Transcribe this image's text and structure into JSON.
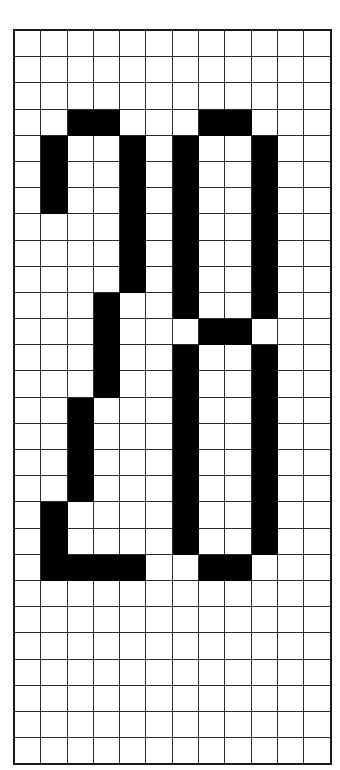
{
  "canvas": {
    "width": 340,
    "height": 770,
    "background": "#ffffff"
  },
  "figure": {
    "name": "pixel-grid-glyph-figure",
    "cell_on_color": "#000000",
    "cell_off_color": "#ffffff",
    "gridline_color": "#2b2b2b",
    "border_color": "#1a1a1a"
  },
  "grid": {
    "columns": 12,
    "rows": 28,
    "cell_width_px": 25.3,
    "cell_height_px": 25.2,
    "origin_x_px": 13,
    "origin_y_px": 29,
    "show_gridlines": true,
    "filled_cells": [
      [
        3,
        2
      ],
      [
        3,
        3
      ],
      [
        3,
        7
      ],
      [
        3,
        8
      ],
      [
        4,
        1
      ],
      [
        4,
        4
      ],
      [
        4,
        6
      ],
      [
        4,
        9
      ],
      [
        5,
        1
      ],
      [
        5,
        4
      ],
      [
        5,
        6
      ],
      [
        5,
        9
      ],
      [
        6,
        1
      ],
      [
        6,
        4
      ],
      [
        6,
        6
      ],
      [
        6,
        9
      ],
      [
        7,
        4
      ],
      [
        7,
        6
      ],
      [
        7,
        9
      ],
      [
        8,
        4
      ],
      [
        8,
        6
      ],
      [
        8,
        9
      ],
      [
        9,
        4
      ],
      [
        9,
        6
      ],
      [
        9,
        9
      ],
      [
        10,
        3
      ],
      [
        10,
        6
      ],
      [
        10,
        9
      ],
      [
        11,
        3
      ],
      [
        11,
        7
      ],
      [
        11,
        8
      ],
      [
        12,
        3
      ],
      [
        12,
        6
      ],
      [
        12,
        9
      ],
      [
        13,
        3
      ],
      [
        13,
        6
      ],
      [
        13,
        9
      ],
      [
        14,
        2
      ],
      [
        14,
        6
      ],
      [
        14,
        9
      ],
      [
        15,
        2
      ],
      [
        15,
        6
      ],
      [
        15,
        9
      ],
      [
        16,
        2
      ],
      [
        16,
        6
      ],
      [
        16,
        9
      ],
      [
        17,
        2
      ],
      [
        17,
        6
      ],
      [
        17,
        9
      ],
      [
        18,
        1
      ],
      [
        18,
        6
      ],
      [
        18,
        9
      ],
      [
        19,
        1
      ],
      [
        19,
        6
      ],
      [
        19,
        9
      ],
      [
        20,
        1
      ],
      [
        20,
        2
      ],
      [
        20,
        3
      ],
      [
        20,
        4
      ],
      [
        20,
        7
      ],
      [
        20,
        8
      ]
    ],
    "glyphs": [
      {
        "label": "left-glyph",
        "shape": "digit-two",
        "column_range": [
          1,
          4
        ],
        "row_range": [
          3,
          20
        ]
      },
      {
        "label": "right-glyph",
        "shape": "letter-a",
        "column_range": [
          6,
          9
        ],
        "row_range": [
          3,
          20
        ]
      }
    ]
  }
}
